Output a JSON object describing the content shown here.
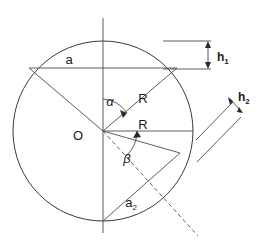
{
  "figure": {
    "background_color": "#ffffff",
    "line_color": "#3a3a3a",
    "text_color": "#1a1a1a"
  },
  "labels": {
    "center": "O",
    "chord_a": "a",
    "chord_a2_base": "a",
    "chord_a2_sub": "2",
    "radius_upper": "R",
    "radius_lower": "R",
    "angle_alpha": "α",
    "angle_beta": "β",
    "height_h1_base": "h",
    "height_h1_sub": "1",
    "height_h2_base": "h",
    "height_h2_sub": "2"
  },
  "geometry": {
    "circle": {
      "cx": 103,
      "cy": 131,
      "r": 90
    },
    "center_point": {
      "x": 103,
      "y": 131
    },
    "vertical_axis": {
      "x": 103,
      "y_top": 18,
      "y_bottom": 233
    },
    "chord_a": {
      "x1": 29,
      "y1": 68,
      "x2": 177,
      "y2": 68
    },
    "chord_a2": {
      "x1": 103,
      "y1": 221,
      "x2": 180,
      "y2": 153
    },
    "radius_upper_right": {
      "x1": 103,
      "y1": 131,
      "x2": 177,
      "y2": 68
    },
    "radius_upper_left": {
      "x1": 103,
      "y1": 131,
      "x2": 29,
      "y2": 68
    },
    "radius_horizontal_right": {
      "x1": 103,
      "y1": 131,
      "x2": 193,
      "y2": 131
    },
    "radius_to_a2_end": {
      "x1": 103,
      "y1": 131,
      "x2": 180,
      "y2": 153
    },
    "dashed_line": {
      "x1": 103,
      "y1": 131,
      "x2": 198,
      "y2": 236
    },
    "angle_alpha_arc": {
      "start_deg": 270,
      "end_deg": 320,
      "radius": 32
    },
    "angle_beta_arc": {
      "start_deg": 0,
      "end_deg": 48,
      "radius": 34
    },
    "h1_indicator": {
      "top_line": {
        "x1": 163,
        "y1": 41,
        "x2": 211,
        "y2": 41
      },
      "bottom_line": {
        "x1": 163,
        "y1": 69,
        "x2": 211,
        "y2": 69
      },
      "arrow": {
        "x": 208,
        "y_top": 41,
        "y_bottom": 69
      }
    },
    "h2_indicator": {
      "upper_line": {
        "x1": 196,
        "y1": 139,
        "x2": 234,
        "y2": 101
      },
      "lower_line": {
        "x1": 196,
        "y1": 161,
        "x2": 240,
        "y2": 116
      },
      "arrow": {
        "x1": 228,
        "y1": 97,
        "x2": 243,
        "y2": 113
      }
    }
  },
  "label_positions": {
    "center": {
      "x": 78,
      "y": 140
    },
    "chord_a": {
      "x": 69,
      "y": 64
    },
    "chord_a2": {
      "x": 131,
      "y": 207
    },
    "radius_upper": {
      "x": 143,
      "y": 103
    },
    "radius_lower": {
      "x": 143,
      "y": 129
    },
    "angle_alpha": {
      "x": 110,
      "y": 106
    },
    "angle_beta": {
      "x": 127,
      "y": 162
    },
    "height_h1": {
      "x": 217,
      "y": 61
    },
    "height_h2": {
      "x": 238,
      "y": 100
    }
  }
}
